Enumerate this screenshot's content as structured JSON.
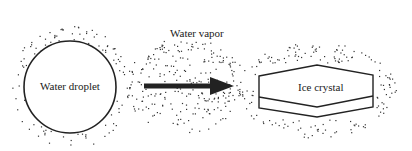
{
  "diagram": {
    "labels": {
      "droplet": "Water droplet",
      "vapor": "Water vapor",
      "crystal": "Ice crystal"
    },
    "colors": {
      "stroke": "#222222",
      "dots": "#333333",
      "background": "#ffffff"
    },
    "nodes": [
      {
        "id": "droplet",
        "shape": "circle",
        "label_key": "droplet"
      },
      {
        "id": "crystal",
        "shape": "hexagonal-prism",
        "label_key": "crystal"
      }
    ],
    "edges": [
      {
        "from": "droplet",
        "to": "crystal",
        "label_key": "vapor",
        "style": "thick-arrow"
      }
    ]
  }
}
